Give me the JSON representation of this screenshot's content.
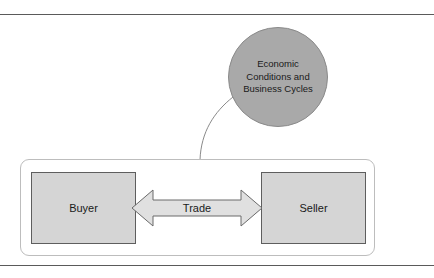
{
  "diagram": {
    "background_color": "#ffffff",
    "rules": {
      "top_label": "top-divider-rule",
      "bottom_label": "bottom-divider-rule",
      "color": "#5a5a5a"
    },
    "circle_node": {
      "label": "Economic\nConditions and\nBusiness Cycles",
      "fill_color": "#a9a9a9",
      "stroke_color": "#8a8a8a",
      "text_color": "#1a1a1a"
    },
    "container": {
      "name": "market-container",
      "stroke_color": "#bdbdbd",
      "fill_color": "#ffffff"
    },
    "nodes": [
      {
        "id": "buyer",
        "label": "Buyer",
        "fill_color": "#d5d5d5",
        "stroke_color": "#5e5e5e"
      },
      {
        "id": "seller",
        "label": "Seller",
        "fill_color": "#d5d5d5",
        "stroke_color": "#5e5e5e"
      }
    ],
    "connector_arrow": {
      "label": "Trade",
      "direction": "bidirectional",
      "fill_color": "#e0e0e0",
      "stroke_color": "#6a6a6a",
      "text_color": "#1a1a1a"
    },
    "curve_connector": {
      "name": "economic-conditions-to-market-curve",
      "stroke_color": "#8a8a8a"
    }
  }
}
